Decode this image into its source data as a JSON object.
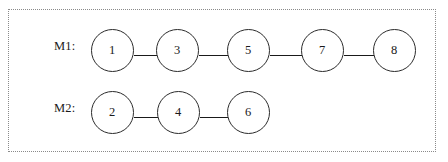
{
  "diagram": {
    "title": "",
    "frame": {
      "border_style": "dotted",
      "border_color": "#8a8a8a"
    },
    "colors": {
      "node_stroke": "#2b2b2b",
      "node_fill": "#ffffff",
      "edge": "#1a1a1a",
      "text": "#1a1a1a",
      "frame": "#8a8a8a"
    },
    "rows": [
      {
        "label": "M1:",
        "nodes": [
          {
            "id": "n1",
            "label": "1",
            "cx": 112
          },
          {
            "id": "n3",
            "label": "3",
            "cx": 177
          },
          {
            "id": "n5",
            "label": "5",
            "cx": 248
          },
          {
            "id": "n7",
            "label": "7",
            "cx": 322
          },
          {
            "id": "n8",
            "label": "8",
            "cx": 394
          }
        ],
        "edges": [
          {
            "from": "1",
            "to": "3"
          },
          {
            "from": "3",
            "to": "5"
          },
          {
            "from": "5",
            "to": "7"
          },
          {
            "from": "7",
            "to": "8"
          }
        ]
      },
      {
        "label": "M2:",
        "nodes": [
          {
            "id": "n2",
            "label": "2",
            "cx": 112
          },
          {
            "id": "n4",
            "label": "4",
            "cx": 178
          },
          {
            "id": "n6",
            "label": "6",
            "cx": 248
          }
        ],
        "edges": [
          {
            "from": "2",
            "to": "4"
          },
          {
            "from": "4",
            "to": "6"
          }
        ]
      }
    ]
  }
}
